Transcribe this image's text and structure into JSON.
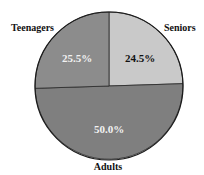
{
  "chart_data": {
    "type": "pie",
    "title": "",
    "categories": [
      "Seniors",
      "Adults",
      "Teenagers"
    ],
    "values": [
      24.5,
      50.0,
      25.5
    ],
    "value_labels": [
      "24.5%",
      "50.0%",
      "25.5%"
    ],
    "colors": [
      "#c9c9c9",
      "#7f7f7f",
      "#8c8c8c"
    ],
    "label_colors": [
      "#111111",
      "#f2f2f2",
      "#f2f2f2"
    ],
    "start_angle_deg": 90,
    "direction": "clockwise",
    "legend": "none"
  },
  "labels": {
    "seniors": "Seniors",
    "adults": "Adults",
    "teenagers": "Teenagers",
    "seniors_pct": "24.5%",
    "adults_pct": "50.0%",
    "teenagers_pct": "25.5%"
  }
}
